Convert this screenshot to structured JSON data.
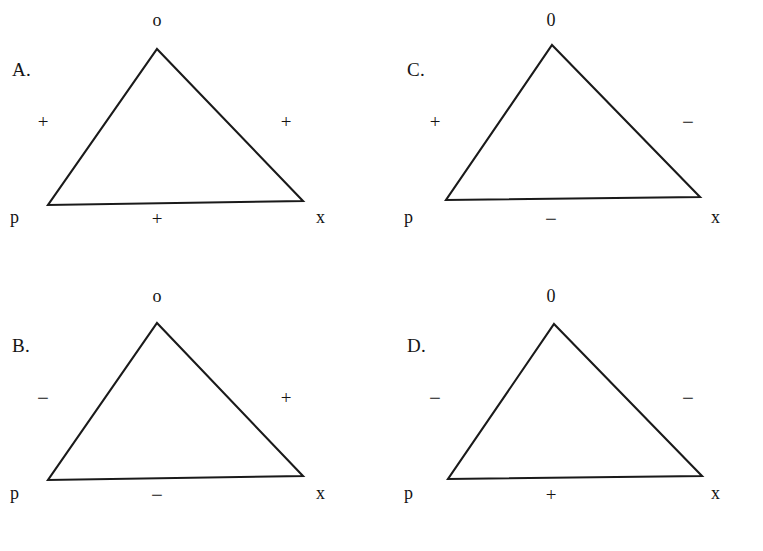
{
  "figure": {
    "background_color": "#ffffff",
    "ink_color": "#1a1a1a",
    "panel_count": 4
  },
  "panels": [
    {
      "key": "A",
      "letter": "A.",
      "apex_label": "o",
      "left_node_label": "p",
      "right_node_label": "x",
      "left_edge_sign": "+",
      "right_edge_sign": "+",
      "bottom_edge_sign": "+",
      "triangle": {
        "apex": {
          "x": 157,
          "y": 49
        },
        "bottom_left": {
          "x": 48,
          "y": 205
        },
        "bottom_right": {
          "x": 303,
          "y": 201
        }
      }
    },
    {
      "key": "B",
      "letter": "B.",
      "apex_label": "o",
      "left_node_label": "p",
      "right_node_label": "x",
      "left_edge_sign": "−",
      "right_edge_sign": "+",
      "bottom_edge_sign": "−",
      "triangle": {
        "apex": {
          "x": 157,
          "y": 47
        },
        "bottom_left": {
          "x": 48,
          "y": 204
        },
        "bottom_right": {
          "x": 303,
          "y": 200
        }
      }
    },
    {
      "key": "C",
      "letter": "C.",
      "apex_label": "0",
      "left_node_label": "p",
      "right_node_label": "x",
      "left_edge_sign": "+",
      "right_edge_sign": "−",
      "bottom_edge_sign": "−",
      "triangle": {
        "apex": {
          "x": 170,
          "y": 45
        },
        "bottom_left": {
          "x": 64,
          "y": 200
        },
        "bottom_right": {
          "x": 318,
          "y": 197
        }
      }
    },
    {
      "key": "D",
      "letter": "D.",
      "apex_label": "0",
      "left_node_label": "p",
      "right_node_label": "x",
      "left_edge_sign": "−",
      "right_edge_sign": "−",
      "bottom_edge_sign": "+",
      "triangle": {
        "apex": {
          "x": 172,
          "y": 48
        },
        "bottom_left": {
          "x": 66,
          "y": 203
        },
        "bottom_right": {
          "x": 320,
          "y": 200
        }
      }
    }
  ]
}
